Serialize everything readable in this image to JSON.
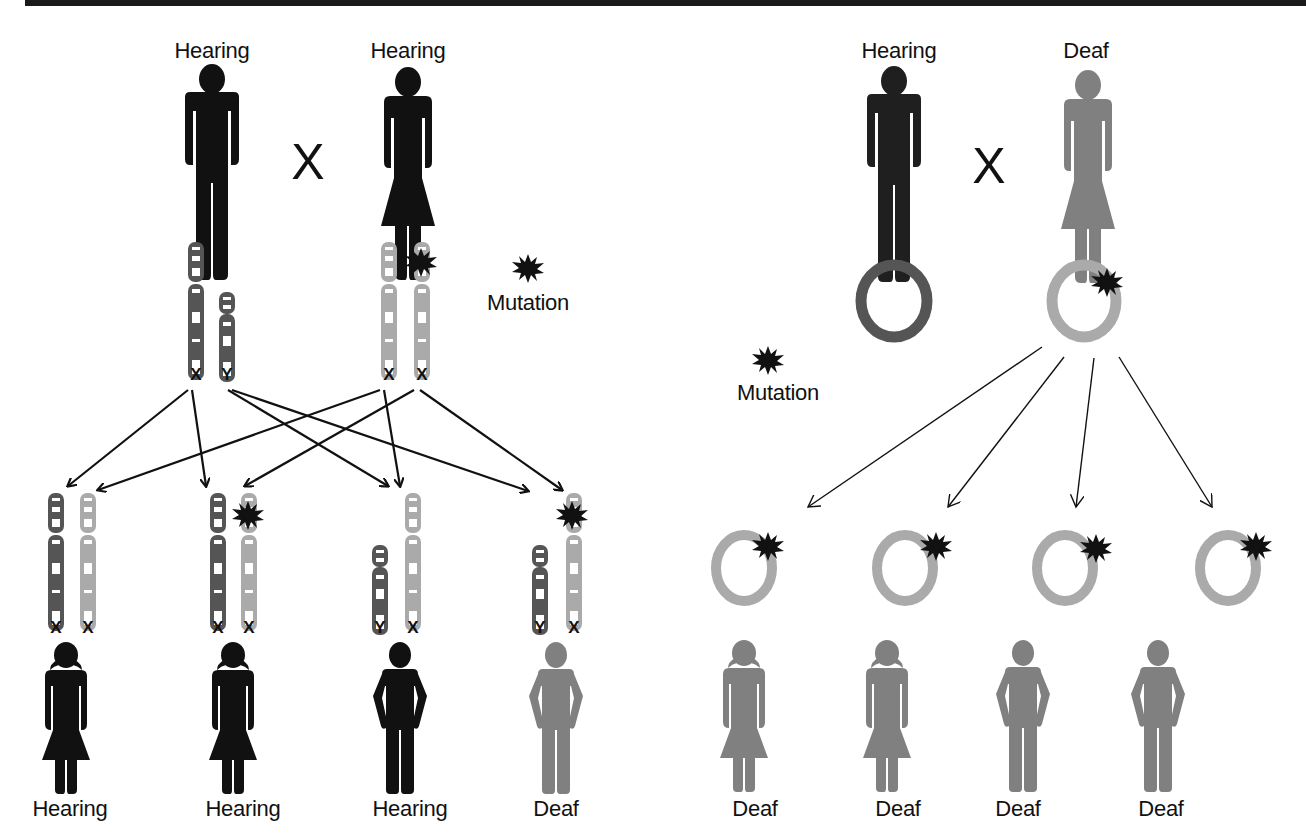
{
  "left_panel": {
    "title": "X-linked inheritance",
    "parents": [
      {
        "label": "Hearing",
        "sex": "male",
        "color": "#111111",
        "chromosomes": [
          "X",
          "Y"
        ]
      },
      {
        "label": "Hearing",
        "sex": "female",
        "color": "#111111",
        "chromosomes": [
          "X",
          "X"
        ],
        "mutation_on": 1
      }
    ],
    "cross_symbol": "X",
    "legend": {
      "label": "Mutation",
      "icon": "starburst-icon"
    },
    "children": [
      {
        "label": "Hearing",
        "sex": "female",
        "color": "#111111",
        "chromosomes": [
          "X",
          "X"
        ],
        "mutation": false
      },
      {
        "label": "Hearing",
        "sex": "female",
        "color": "#111111",
        "chromosomes": [
          "X",
          "X"
        ],
        "mutation": true
      },
      {
        "label": "Hearing",
        "sex": "male",
        "color": "#111111",
        "chromosomes": [
          "Y",
          "X"
        ],
        "mutation": false
      },
      {
        "label": "Deaf",
        "sex": "male",
        "color": "#808080",
        "chromosomes": [
          "Y",
          "X"
        ],
        "mutation": true
      }
    ]
  },
  "right_panel": {
    "title": "Mitochondrial inheritance",
    "parents": [
      {
        "label": "Hearing",
        "sex": "male",
        "color": "#1f1f1f",
        "ring_color": "#555555"
      },
      {
        "label": "Deaf",
        "sex": "female",
        "color": "#808080",
        "ring_color": "#aaaaaa",
        "mutation": true
      }
    ],
    "cross_symbol": "X",
    "legend": {
      "label": "Mutation",
      "icon": "starburst-icon"
    },
    "children": [
      {
        "label": "Deaf",
        "sex": "female",
        "color": "#808080",
        "mutation": true
      },
      {
        "label": "Deaf",
        "sex": "female",
        "color": "#808080",
        "mutation": true
      },
      {
        "label": "Deaf",
        "sex": "male",
        "color": "#808080",
        "mutation": true
      },
      {
        "label": "Deaf",
        "sex": "male",
        "color": "#808080",
        "mutation": true
      }
    ]
  },
  "colors": {
    "paternal_chromosome": "#555555",
    "maternal_chromosome": "#aaaaaa",
    "hearing": "#111111",
    "deaf": "#808080",
    "mutation": "#111111"
  }
}
